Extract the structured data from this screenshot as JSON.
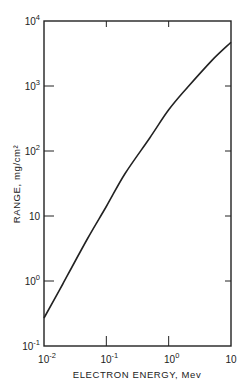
{
  "chart_data": {
    "type": "line",
    "title": "",
    "xlabel": "ELECTRON ENERGY, Mev",
    "ylabel": "RANGE, mg/cm²",
    "xscale": "log",
    "yscale": "log",
    "xlim": [
      0.01,
      10
    ],
    "ylim": [
      0.1,
      10000
    ],
    "grid": false,
    "legend": null,
    "x_ticks": [
      {
        "base": "10",
        "exp": "-2"
      },
      {
        "base": "10",
        "exp": "-1"
      },
      {
        "base": "10",
        "exp": "0"
      },
      {
        "base": "10",
        "exp": ""
      }
    ],
    "y_ticks": [
      {
        "base": "10",
        "exp": "-1"
      },
      {
        "base": "10",
        "exp": "0"
      },
      {
        "base": "10",
        "exp": ""
      },
      {
        "base": "10",
        "exp": "2"
      },
      {
        "base": "10",
        "exp": "3"
      },
      {
        "base": "10",
        "exp": "4"
      }
    ],
    "series": [
      {
        "name": "Electron range",
        "x": [
          0.01,
          0.02,
          0.05,
          0.1,
          0.2,
          0.5,
          1,
          2,
          5,
          10
        ],
        "y": [
          0.27,
          0.9,
          4.5,
          14,
          45,
          160,
          430,
          950,
          2500,
          4700
        ]
      }
    ]
  }
}
